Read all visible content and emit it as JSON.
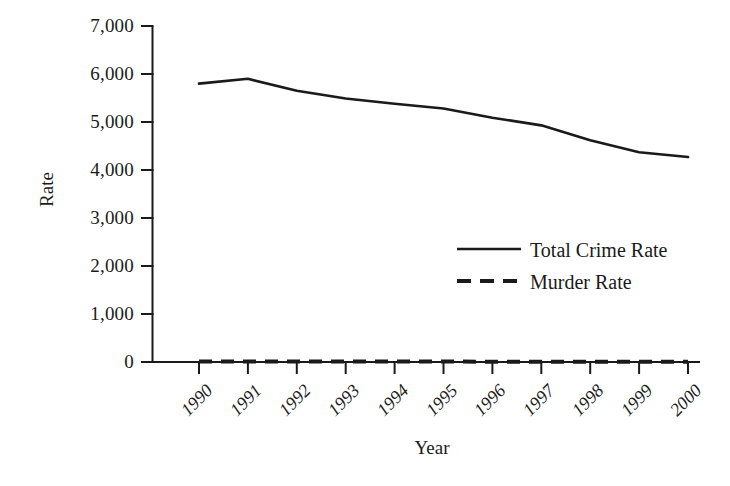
{
  "chart_data": {
    "type": "line",
    "title": "",
    "xlabel": "Year",
    "ylabel": "Rate",
    "x": [
      1990,
      1991,
      1992,
      1993,
      1994,
      1995,
      1996,
      1997,
      1998,
      1999,
      2000
    ],
    "categories": [
      "1990",
      "1991",
      "1992",
      "1993",
      "1994",
      "1995",
      "1996",
      "1997",
      "1998",
      "1999",
      "2000"
    ],
    "series": [
      {
        "name": "Total Crime Rate",
        "style": "solid",
        "color": "#1a1a1a",
        "values": [
          5800,
          5900,
          5650,
          5490,
          5380,
          5280,
          5090,
          4930,
          4620,
          4370,
          4270
        ]
      },
      {
        "name": "Murder Rate",
        "style": "dashed",
        "color": "#1a1a1a",
        "values": [
          9.4,
          9.8,
          9.3,
          9.5,
          9.0,
          8.2,
          7.4,
          6.8,
          6.3,
          5.7,
          5.5
        ]
      }
    ],
    "ylim": [
      0,
      7000
    ],
    "yticks": [
      0,
      1000,
      2000,
      3000,
      4000,
      5000,
      6000,
      7000
    ],
    "ytick_labels": [
      "0",
      "1,000",
      "2,000",
      "3,000",
      "4,000",
      "5,000",
      "6,000",
      "7,000"
    ],
    "grid": false,
    "legend_position": "center-right",
    "legend": [
      {
        "label": "Total Crime Rate",
        "style": "solid"
      },
      {
        "label": "Murder Rate",
        "style": "dashed"
      }
    ]
  }
}
